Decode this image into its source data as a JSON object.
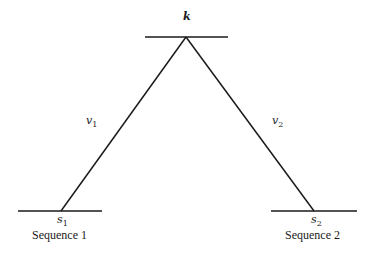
{
  "diagram": {
    "top_node": {
      "label": "k"
    },
    "left_node": {
      "label": "s",
      "subscript": "1",
      "caption": "Sequence 1"
    },
    "right_node": {
      "label": "s",
      "subscript": "2",
      "caption": "Sequence 2"
    },
    "left_edge": {
      "label": "v",
      "subscript": "1"
    },
    "right_edge": {
      "label": "v",
      "subscript": "2"
    },
    "line_color": "#1a1a1a"
  }
}
